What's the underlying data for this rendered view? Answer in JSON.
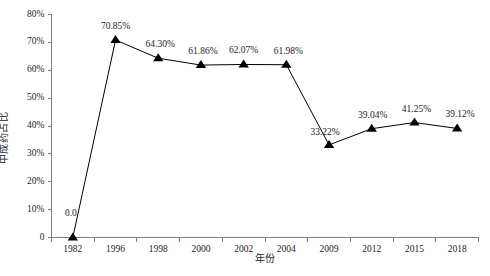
{
  "chart_data": {
    "type": "line",
    "title": "",
    "subtitle": "",
    "xlabel": "年份",
    "ylabel": "中成药占比",
    "categories": [
      "1982",
      "1996",
      "1998",
      "2000",
      "2002",
      "2004",
      "2009",
      "2012",
      "2015",
      "2018"
    ],
    "values": [
      0.0,
      70.85,
      64.3,
      61.86,
      62.07,
      61.98,
      33.22,
      39.04,
      41.25,
      39.12
    ],
    "point_labels": [
      "0.0",
      "70.85%",
      "64.30%",
      "61.86%",
      "62.07%",
      "61.98%",
      "33.22%",
      "39.04%",
      "41.25%",
      "39.12%"
    ],
    "series": [
      {
        "name": "中成药占比",
        "values": [
          0.0,
          70.85,
          64.3,
          61.86,
          62.07,
          61.98,
          33.22,
          39.04,
          41.25,
          39.12
        ],
        "marker": "triangle",
        "color": "#000000"
      }
    ],
    "ylim": [
      0,
      80
    ],
    "ytick_labels": [
      "0",
      "10%",
      "20%",
      "30%",
      "40%",
      "50%",
      "60%",
      "70%",
      "80%"
    ],
    "ytick_values": [
      0,
      10,
      20,
      30,
      40,
      50,
      60,
      70,
      80
    ],
    "grid": false,
    "legend": false,
    "legend_position": "none",
    "line_color": "#000000",
    "marker_color": "#000000",
    "axis_color": "#808080",
    "background": "#ffffff"
  }
}
